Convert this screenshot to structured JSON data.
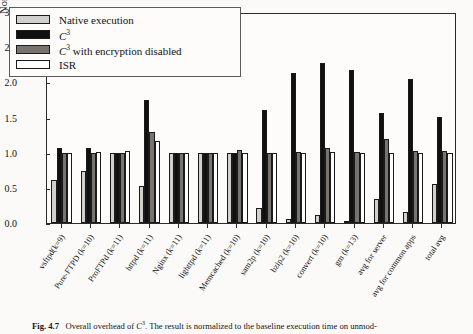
{
  "figure": {
    "caption_label": "Fig. 4.7",
    "caption_text": "Overall overhead of C3. The result is normalized to the baseline execution time on unmod-"
  },
  "chart_data": {
    "type": "bar",
    "title": "",
    "xlabel": "",
    "ylabel": "Normalized Execution Time",
    "ylim": [
      0.0,
      3.0
    ],
    "yticks": [
      "0.0",
      "0.5",
      "1.0",
      "1.5",
      "2.0",
      "2.5",
      "3.0"
    ],
    "grid": false,
    "legend_position": "upper-left-inside",
    "categories": [
      "vsftpd(k=9)",
      "Pure-FTPD (k=10)",
      "ProFTPd (k=11)",
      "httpd (k=11)",
      "Nginx (k=11)",
      "lighttpd (k=11)",
      "Memcached (k=10)",
      "sam2p (k=10)",
      "bzip2 (k=10)",
      "convert (k=10)",
      "gm (k=13)",
      "avg for server",
      "avg for common apps",
      "total avg"
    ],
    "series": [
      {
        "name": "Native execution",
        "color": "#d2d0cd",
        "values": [
          0.61,
          0.74,
          1.0,
          0.52,
          1.0,
          1.0,
          1.0,
          0.21,
          0.05,
          0.12,
          0.03,
          0.34,
          0.15,
          0.55
        ]
      },
      {
        "name": "C3",
        "color": "#101010",
        "values": [
          1.07,
          1.07,
          1.0,
          1.75,
          1.0,
          1.0,
          1.0,
          1.61,
          2.14,
          2.27,
          2.17,
          1.57,
          2.05,
          1.51
        ]
      },
      {
        "name": "C3 with encryption disabled",
        "color": "#77746f",
        "values": [
          1.0,
          1.0,
          1.0,
          1.29,
          1.0,
          1.0,
          1.04,
          1.0,
          1.01,
          1.06,
          1.01,
          1.2,
          1.02,
          1.03
        ]
      },
      {
        "name": "ISR",
        "color": "#ffffff",
        "values": [
          1.0,
          1.01,
          1.02,
          1.17,
          1.0,
          1.0,
          1.0,
          1.0,
          1.0,
          1.01,
          1.0,
          1.0,
          1.0,
          1.0
        ]
      }
    ]
  },
  "legend": {
    "items": [
      {
        "label": "Native execution",
        "color": "#d2d0cd"
      },
      {
        "label": "C3",
        "color": "#101010"
      },
      {
        "label": "C3 with encryption disabled",
        "color": "#77746f"
      },
      {
        "label": "ISR",
        "color": "#ffffff"
      }
    ]
  }
}
